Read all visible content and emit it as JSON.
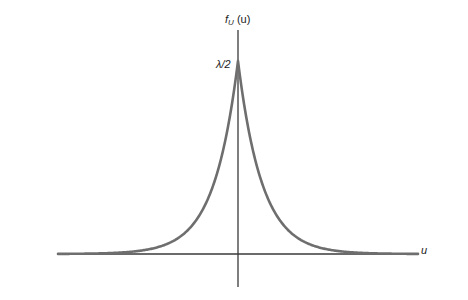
{
  "chart_data": {
    "type": "line",
    "title": "",
    "function": "f_U(u) = (λ/2) e^(-λ|u|)  (Laplace / double-exponential density)",
    "xlabel": "u",
    "ylabel": "f_U (u)",
    "ylabel_parts": {
      "f": "f",
      "sub": "U",
      "arg": "(u)"
    },
    "annotations": [
      {
        "text": "λ/2",
        "at": "peak value on y-axis (u = 0)"
      }
    ],
    "grid": false,
    "legend": null,
    "x_range_relative": [
      -7.5,
      7.5
    ],
    "peak": {
      "u": 0,
      "value": "λ/2"
    },
    "series": [
      {
        "name": "f_U(u)",
        "x": [
          -7.5,
          -6,
          -5,
          -4,
          -3,
          -2,
          -1.5,
          -1,
          -0.5,
          0,
          0.5,
          1,
          1.5,
          2,
          3,
          4,
          5,
          6,
          7.5
        ],
        "values_relative_to_peak": [
          0.0134,
          0.0302,
          0.0498,
          0.0821,
          0.1353,
          0.2231,
          0.2865,
          0.3679,
          0.6065,
          1.0,
          0.6065,
          0.3679,
          0.2865,
          0.2231,
          0.1353,
          0.0821,
          0.0498,
          0.0302,
          0.0134
        ]
      }
    ],
    "plot_geometry": {
      "origin_px": [
        238,
        254
      ],
      "peak_px": [
        238,
        61
      ],
      "x_axis_px": [
        58,
        418
      ],
      "y_axis_px": [
        30,
        287
      ],
      "px_per_unit_lambda": 24
    }
  },
  "labels": {
    "ylabel_f": "f",
    "ylabel_sub": "U",
    "ylabel_arg": " (u)",
    "peak": "λ/2",
    "xlabel": "u"
  },
  "colors": {
    "curve": "#6e6e6e",
    "axes": "#3a3a3a",
    "background": "#ffffff"
  }
}
